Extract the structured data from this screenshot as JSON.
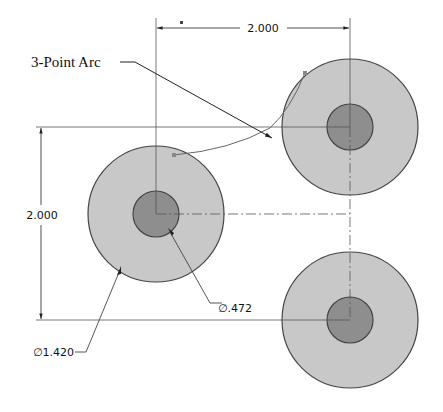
{
  "drawing": {
    "callout_label": "3-Point Arc",
    "dim_horizontal": "2.000",
    "dim_vertical": "2.000",
    "dim_inner_diameter": "∅.472",
    "dim_outer_diameter": "∅1.420"
  },
  "colors": {
    "outer_fill": "#c8c8c8",
    "inner_fill": "#8e8e8e",
    "stroke": "#444444"
  },
  "circles": [
    {
      "name": "left-circle",
      "cx": 156,
      "cy": 214
    },
    {
      "name": "top-right-circle",
      "cx": 350,
      "cy": 127
    },
    {
      "name": "bottom-right-circle",
      "cx": 350,
      "cy": 320
    }
  ]
}
